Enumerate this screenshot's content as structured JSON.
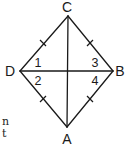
{
  "diagram": {
    "type": "rhombus-with-diagonals",
    "vertices": [
      {
        "label": "C",
        "x": 68,
        "y": 16,
        "label_x": 67,
        "label_y": 12
      },
      {
        "label": "B",
        "x": 113,
        "y": 71,
        "label_x": 120,
        "label_y": 76
      },
      {
        "label": "A",
        "x": 67,
        "y": 127,
        "label_x": 67,
        "label_y": 144
      },
      {
        "label": "D",
        "x": 20,
        "y": 71,
        "label_x": 10,
        "label_y": 76
      }
    ],
    "angles": [
      {
        "label": "1",
        "x": 38,
        "y": 67
      },
      {
        "label": "2",
        "x": 38,
        "y": 85
      },
      {
        "label": "3",
        "x": 95,
        "y": 67
      },
      {
        "label": "4",
        "x": 95,
        "y": 85
      }
    ],
    "congruent_sides": [
      "CD",
      "CB",
      "DA",
      "BA"
    ],
    "diagonals": [
      "CA",
      "DB"
    ],
    "colors": {
      "stroke": "#1a1a1a",
      "background": "#ffffff"
    }
  },
  "page_fragments": [
    {
      "text": "n",
      "x": 2,
      "y": 125
    },
    {
      "text": "t",
      "x": 2,
      "y": 137
    }
  ]
}
